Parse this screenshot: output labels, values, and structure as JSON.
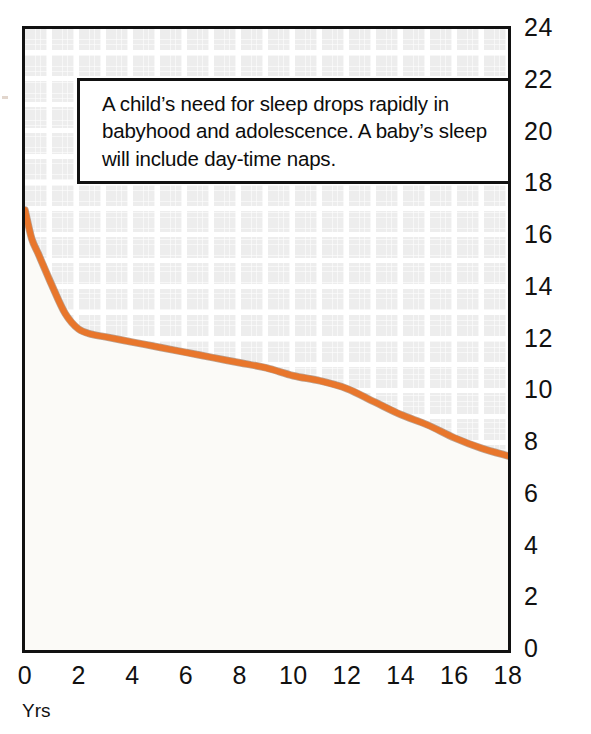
{
  "annotation": {
    "text": "A child’s need for sleep drops rapidly in babyhood and adolescence. A baby’s sleep will include day-time naps."
  },
  "axis_title": {
    "x": "Yrs"
  },
  "colors": {
    "curve": "#E8762C",
    "curve_shadow": "#8a5a3a",
    "frame": "#111111",
    "grid": "#ededed",
    "plot_background": "#fbfaf7",
    "text": "#0d0d0d"
  },
  "chart_data": {
    "type": "line",
    "title": "",
    "subtitle": "",
    "xlabel": "Yrs",
    "ylabel": "",
    "xlim": [
      0,
      18
    ],
    "ylim": [
      0,
      24
    ],
    "xticks": [
      0,
      2,
      4,
      6,
      8,
      10,
      12,
      14,
      16,
      18
    ],
    "yticks": [
      0,
      2,
      4,
      6,
      8,
      10,
      12,
      14,
      16,
      18,
      20,
      22,
      24
    ],
    "xtick_labels": [
      "0",
      "2",
      "4",
      "6",
      "8",
      "10",
      "12",
      "14",
      "16",
      "18"
    ],
    "ytick_labels": [
      "0",
      "2",
      "4",
      "6",
      "8",
      "10",
      "12",
      "14",
      "16",
      "18",
      "20",
      "22",
      "24"
    ],
    "grid": true,
    "legend": false,
    "filled_below": true,
    "annotations": [
      "A child’s need for sleep drops rapidly in babyhood and adolescence. A baby’s sleep will include day-time naps."
    ],
    "series": [
      {
        "name": "Hours of sleep needed",
        "color": "#E8762C",
        "x": [
          0,
          0.25,
          0.5,
          0.75,
          1,
          1.5,
          2,
          2.5,
          3,
          4,
          5,
          6,
          7,
          8,
          9,
          10,
          11,
          12,
          13,
          14,
          15,
          16,
          17,
          18
        ],
        "values": [
          17.0,
          15.9,
          15.3,
          14.7,
          14.1,
          13.0,
          12.4,
          12.2,
          12.1,
          11.9,
          11.7,
          11.5,
          11.3,
          11.1,
          10.9,
          10.6,
          10.4,
          10.1,
          9.6,
          9.1,
          8.7,
          8.2,
          7.8,
          7.5
        ]
      }
    ]
  }
}
